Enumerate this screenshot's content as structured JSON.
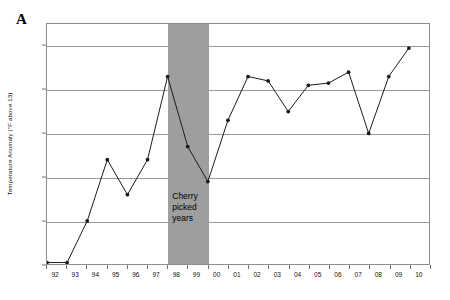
{
  "figure": {
    "panel_label": "A",
    "background_color": "#ffffff",
    "axis_color": "#8d8d8d",
    "grid_color": "#9a9a9a",
    "series_color": "#1a1a1a",
    "band_color": "#9e9e9e"
  },
  "annotation": {
    "band_text": "Cherry\npicked\nyears",
    "band_start_year": 1998,
    "band_end_year": 2000
  },
  "chart_data": {
    "type": "line",
    "title": "",
    "subtitle": "",
    "xlabel": "",
    "ylabel": "Temperature Anomaly (°F above 13)",
    "xlim": [
      1992,
      2011
    ],
    "ylim": [
      0,
      55
    ],
    "grid": true,
    "legend": false,
    "yticks": [
      0,
      10,
      20,
      30,
      40,
      50
    ],
    "ytick_labels": [
      "0",
      "10",
      "20",
      "30",
      "40",
      "50"
    ],
    "xticks": [
      1992,
      1993,
      1994,
      1995,
      1996,
      1997,
      1998,
      1999,
      2000,
      2001,
      2002,
      2003,
      2004,
      2005,
      2006,
      2007,
      2008,
      2009,
      2010
    ],
    "xtick_labels": [
      "92",
      "93",
      "94",
      "95",
      "96",
      "97",
      "98",
      "99",
      "00",
      "01",
      "02",
      "03",
      "04",
      "05",
      "06",
      "07",
      "08",
      "09",
      "10"
    ],
    "markers": true,
    "x": [
      1992,
      1993,
      1994,
      1995,
      1996,
      1997,
      1998,
      1999,
      2000,
      2001,
      2002,
      2003,
      2004,
      2005,
      2006,
      2007,
      2008,
      2009,
      2010
    ],
    "values": [
      0.5,
      0.5,
      10,
      24,
      16,
      24,
      43,
      27,
      19,
      33,
      43,
      42,
      35,
      41,
      41.5,
      44,
      30,
      43,
      49.5
    ],
    "categories": [
      "92",
      "93",
      "94",
      "95",
      "96",
      "97",
      "98",
      "99",
      "00",
      "01",
      "02",
      "03",
      "04",
      "05",
      "06",
      "07",
      "08",
      "09",
      "10"
    ],
    "shaded_regions": [
      {
        "label": "Cherry picked years",
        "x_start": 1998,
        "x_end": 2000,
        "color": "#9e9e9e"
      }
    ]
  }
}
